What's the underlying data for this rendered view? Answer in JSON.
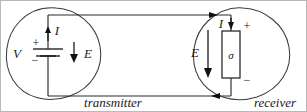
{
  "figure": {
    "kind": "circuit-diagram",
    "background": "#ffffff",
    "ink": "#1a1a1a",
    "blob_stroke": "#3a3a3a",
    "frame_color": "#b9b9b9",
    "width": 307,
    "height": 112
  },
  "transmitter": {
    "caption": "transmitter",
    "source_label": "V",
    "plus_sign": "+",
    "minus_sign": "−",
    "current_label": "I",
    "field_label": "E"
  },
  "receiver": {
    "caption": "receiver",
    "element_label": "σ",
    "plus_sign": "+",
    "minus_sign": "−",
    "current_label": "I",
    "field_label": "E"
  },
  "wires": {
    "top_current_direction": "right",
    "bottom_current_direction": "left"
  }
}
